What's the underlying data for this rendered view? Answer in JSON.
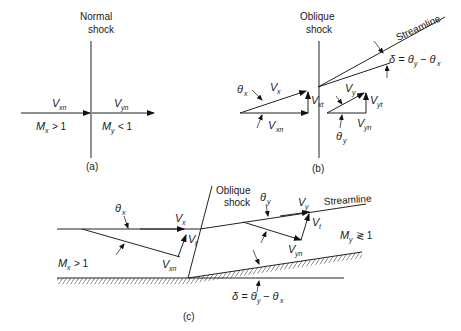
{
  "figure": {
    "panel_a": {
      "caption": "(a)",
      "shock_label_line1": "Normal",
      "shock_label_line2": "shock",
      "upstream_velocity": "V",
      "upstream_velocity_sub": "xn",
      "downstream_velocity": "V",
      "downstream_velocity_sub": "yn",
      "upstream_mach": "M",
      "upstream_mach_sub": "x",
      "upstream_mach_rel": "> 1",
      "downstream_mach": "M",
      "downstream_mach_sub": "y",
      "downstream_mach_rel": "< 1"
    },
    "panel_b": {
      "caption": "(b)",
      "shock_label_line1": "Oblique",
      "shock_label_line2": "shock",
      "streamline_label": "Streamline",
      "deflection_label": "δ = θ",
      "deflection_sub_y": "y",
      "deflection_minus": "− θ",
      "deflection_sub_x": "x",
      "theta_x": "θ",
      "theta_x_sub": "x",
      "theta_y": "θ",
      "theta_y_sub": "y",
      "vx": "V",
      "vx_sub": "x",
      "vxn": "V",
      "vxn_sub": "xn",
      "vxt": "V",
      "vxt_sub": "xt",
      "vy": "V",
      "vy_sub": "y",
      "vyn": "V",
      "vyn_sub": "yn",
      "vyt": "V",
      "vyt_sub": "yt"
    },
    "panel_c": {
      "caption": "(c)",
      "shock_label_line1": "Oblique",
      "shock_label_line2": "shock",
      "streamline_label": "Streamline",
      "theta_x": "θ",
      "theta_x_sub": "x",
      "theta_y": "θ",
      "theta_y_sub": "y",
      "vx": "V",
      "vx_sub": "x",
      "vt1": "V",
      "vt1_sub": "t",
      "vxn": "V",
      "vxn_sub": "xn",
      "vy": "V",
      "vy_sub": "y",
      "vt2": "V",
      "vt2_sub": "t",
      "vyn": "V",
      "vyn_sub": "yn",
      "upstream_mach": "M",
      "upstream_mach_sub": "x",
      "upstream_mach_rel": "> 1",
      "downstream_mach": "M",
      "downstream_mach_sub": "y",
      "downstream_mach_rel": "≷ 1",
      "deflection_label": "δ = θ",
      "deflection_sub_y": "y",
      "deflection_minus": "− θ",
      "deflection_sub_x": "x"
    }
  }
}
